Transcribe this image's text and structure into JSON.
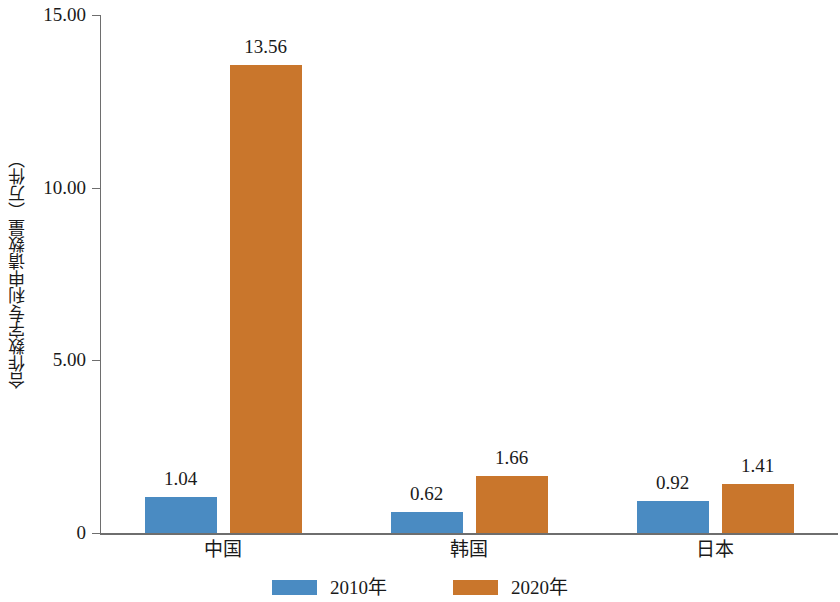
{
  "chart_data": {
    "type": "bar",
    "title": "",
    "subtitle": "",
    "xlabel": "",
    "ylabel": "合作数字专利申请数量（万件）",
    "categories": [
      "中国",
      "韩国",
      "日本"
    ],
    "series": [
      {
        "name": "2010年",
        "color": "#4a8bc2",
        "values": [
          1.04,
          0.62,
          0.92
        ]
      },
      {
        "name": "2020年",
        "color": "#c9762c",
        "values": [
          13.56,
          1.66,
          1.41
        ]
      }
    ],
    "value_labels": {
      "2010年": [
        "1.04",
        "0.62",
        "0.92"
      ],
      "2020年": [
        "13.56",
        "1.66",
        "1.41"
      ]
    },
    "ylim": [
      0,
      15
    ],
    "ytick_values": [
      15,
      10,
      5,
      0
    ],
    "ytick_labels": [
      "15.00",
      "10.00",
      "5.00",
      "0"
    ],
    "grid": false,
    "legend_position": "bottom"
  },
  "axis": {
    "y_title": "合作数字专利申请数量（万件）",
    "y_ticks": [
      {
        "label": "15.00",
        "value": 15
      },
      {
        "label": "10.00",
        "value": 10
      },
      {
        "label": "5.00",
        "value": 5
      },
      {
        "label": "0",
        "value": 0
      }
    ],
    "x_categories": [
      {
        "label": "中国"
      },
      {
        "label": "韩国"
      },
      {
        "label": "日本"
      }
    ]
  },
  "bars": [
    {
      "group": "中国",
      "series": "2010年",
      "value": 1.04,
      "label": "1.04",
      "color": "#4a8bc2"
    },
    {
      "group": "中国",
      "series": "2020年",
      "value": 13.56,
      "label": "13.56",
      "color": "#c9762c"
    },
    {
      "group": "韩国",
      "series": "2010年",
      "value": 0.62,
      "label": "0.62",
      "color": "#4a8bc2"
    },
    {
      "group": "韩国",
      "series": "2020年",
      "value": 1.66,
      "label": "1.66",
      "color": "#c9762c"
    },
    {
      "group": "日本",
      "series": "2010年",
      "value": 0.92,
      "label": "0.92",
      "color": "#4a8bc2"
    },
    {
      "group": "日本",
      "series": "2020年",
      "value": 1.41,
      "label": "1.41",
      "color": "#c9762c"
    }
  ],
  "legend": {
    "items": [
      {
        "label": "2010年",
        "color": "#4a8bc2"
      },
      {
        "label": "2020年",
        "color": "#c9762c"
      }
    ]
  },
  "colors": {
    "series_2010": "#4a8bc2",
    "series_2020": "#c9762c",
    "axis": "#6e6e6e",
    "text": "#1a1a1a",
    "background": "#ffffff"
  }
}
